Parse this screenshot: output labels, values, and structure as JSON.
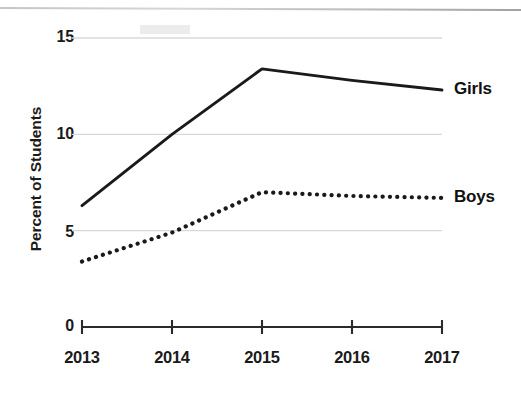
{
  "chart_data": {
    "type": "line",
    "title": "",
    "subtitle": "",
    "xlabel": "",
    "ylabel": "Percent of Students",
    "categories": [
      "2013",
      "2014",
      "2015",
      "2016",
      "2017"
    ],
    "x": [
      2013,
      2014,
      2015,
      2016,
      2017
    ],
    "xlim": [
      2013,
      2017
    ],
    "ylim": [
      0,
      15
    ],
    "yticks": [
      "0",
      "5",
      "10",
      "15"
    ],
    "ytick_values": [
      0,
      5,
      10,
      15
    ],
    "grid": "horizontal-gridlines-at-5-10-15",
    "legend_position": "inline-right-of-series",
    "series": [
      {
        "name": "Girls",
        "style": "solid",
        "color": "#1a1a1a",
        "values": [
          6.3,
          10.0,
          13.4,
          12.8,
          12.3
        ]
      },
      {
        "name": "Boys",
        "style": "dotted",
        "color": "#1a1a1a",
        "values": [
          3.4,
          4.9,
          7.0,
          6.8,
          6.7
        ]
      }
    ],
    "annotations": []
  },
  "axis": {
    "y_title": "Percent of Students",
    "y_ticks": [
      {
        "label": "15",
        "value": 15
      },
      {
        "label": "10",
        "value": 10
      },
      {
        "label": "5",
        "value": 5
      },
      {
        "label": "0",
        "value": 0
      }
    ],
    "x_ticks": [
      {
        "label": "2013",
        "value": 2013
      },
      {
        "label": "2014",
        "value": 2014
      },
      {
        "label": "2015",
        "value": 2015
      },
      {
        "label": "2016",
        "value": 2016
      },
      {
        "label": "2017",
        "value": 2017
      }
    ]
  },
  "series_labels": {
    "girls": "Girls",
    "boys": "Boys"
  },
  "colors": {
    "ink": "#1a1a1a",
    "gridline": "#d8d8d8",
    "axis": "#2b2b2b",
    "background": "#ffffff"
  }
}
